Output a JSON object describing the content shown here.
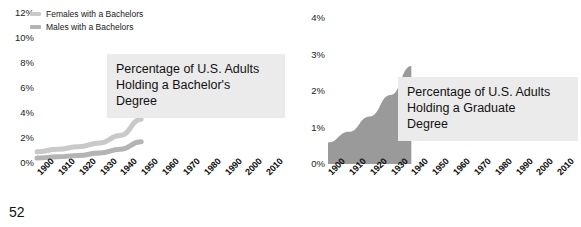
{
  "page": {
    "number": "52",
    "background_color": "#ffffff"
  },
  "colors": {
    "title_box_background": "#ebebeb",
    "text": "#111111",
    "series_light": "#c9c9c9",
    "series_mid": "#b4b4b4",
    "series_dark": "#9a9a9a",
    "series_darkest": "#848484"
  },
  "chart_data": [
    {
      "type": "area",
      "id": "bachelors",
      "title": "Percentage of U.S. Adults Holding a Bachelor's Degree",
      "title_lines": [
        "Percentage of U.S. Adults",
        "Holding a Bachelor's",
        "Degree"
      ],
      "xlabel": "",
      "ylabel": "",
      "grid": false,
      "legend_position": "top-left",
      "ylim": [
        0,
        12
      ],
      "ytick_labels": [
        "12%",
        "10%",
        "8%",
        "6%",
        "4%",
        "2%",
        "0%"
      ],
      "ytick_values": [
        12,
        10,
        8,
        6,
        4,
        2,
        0
      ],
      "categories": [
        "1900",
        "1910",
        "1920",
        "1930",
        "1940",
        "1950",
        "1960",
        "1970",
        "1980",
        "1990",
        "2000",
        "2010"
      ],
      "x": [
        1900,
        1910,
        1920,
        1930,
        1940,
        1950,
        1960,
        1970,
        1980,
        1990,
        2000,
        2010
      ],
      "series": [
        {
          "name": "Females with a Bachelors",
          "color": "#c9c9c9",
          "values": [
            0.9,
            1.1,
            1.3,
            1.6,
            2.2,
            3.5,
            null,
            null,
            null,
            null,
            null,
            null
          ]
        },
        {
          "name": "Males with a Bachelors",
          "color": "#b4b4b4",
          "values": [
            0.4,
            0.5,
            0.6,
            0.8,
            1.1,
            1.7,
            null,
            null,
            null,
            null,
            null,
            null
          ]
        }
      ]
    },
    {
      "type": "area",
      "id": "graduate",
      "title": "Percentage of U.S. Adults Holding a Graduate Degree",
      "title_lines": [
        "Percentage of U.S. Adults",
        "Holding a Graduate",
        "Degree"
      ],
      "xlabel": "",
      "ylabel": "",
      "grid": false,
      "legend_position": "top-left",
      "ylim": [
        0,
        4
      ],
      "ytick_labels": [
        "4%",
        "3%",
        "2%",
        "1%",
        "0%"
      ],
      "ytick_values": [
        4,
        3,
        2,
        1,
        0
      ],
      "categories": [
        "1900",
        "1910",
        "1920",
        "1930",
        "1940",
        "1950",
        "1960",
        "1970",
        "1980",
        "1990",
        "2000",
        "2010"
      ],
      "x": [
        1900,
        1910,
        1920,
        1930,
        1940,
        1950,
        1960,
        1970,
        1980,
        1990,
        2000,
        2010
      ],
      "series": [
        {
          "name": "Females with a Doctorate",
          "color": "#c9c9c9",
          "values": [
            0.02,
            0.03,
            0.04,
            0.05,
            0.07,
            null,
            null,
            null,
            null,
            null,
            null,
            null
          ]
        },
        {
          "name": "Males with a Doctorate",
          "color": "#b4b4b4",
          "values": [
            0.03,
            0.04,
            0.06,
            0.09,
            0.13,
            null,
            null,
            null,
            null,
            null,
            null,
            null
          ]
        },
        {
          "name": "Females with a Masters",
          "color": "#9a9a9a",
          "values": [
            0.04,
            0.06,
            0.09,
            0.13,
            0.18,
            null,
            null,
            null,
            null,
            null,
            null,
            null
          ]
        },
        {
          "name": "Males with a Masters",
          "color": "#848484",
          "values": [
            0.05,
            0.08,
            0.12,
            0.18,
            0.26,
            null,
            null,
            null,
            null,
            null,
            null,
            null
          ]
        }
      ]
    }
  ]
}
